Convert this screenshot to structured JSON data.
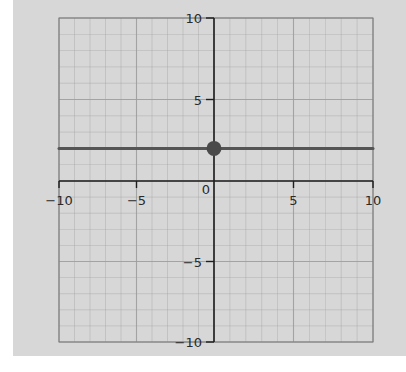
{
  "chart_data": {
    "type": "line",
    "title": "",
    "xlabel": "",
    "ylabel": "",
    "xlim": [
      -10,
      10
    ],
    "ylim": [
      -10,
      10
    ],
    "grid": true,
    "grid_minor_step": 1,
    "x_ticks": [
      -10,
      -5,
      0,
      5,
      10
    ],
    "y_ticks": [
      -10,
      -5,
      5,
      10
    ],
    "x_tick_labels": [
      "−10",
      "−5",
      "0",
      "5",
      "10"
    ],
    "y_tick_labels": [
      "−10",
      "−5",
      "5",
      "10"
    ],
    "series": [
      {
        "name": "y = 2",
        "kind": "horizontal-line",
        "x": [
          -10,
          10
        ],
        "y": [
          2,
          2
        ],
        "color": "#555555"
      }
    ],
    "points": [
      {
        "name": "y-intercept",
        "x": 0,
        "y": 2,
        "color": "#4a4a4a"
      }
    ]
  },
  "colors": {
    "paper": "#d7d7d7",
    "grid": "#9e9e9e",
    "axis": "#1e1e1e",
    "line": "#555555",
    "point": "#4a4a4a"
  }
}
